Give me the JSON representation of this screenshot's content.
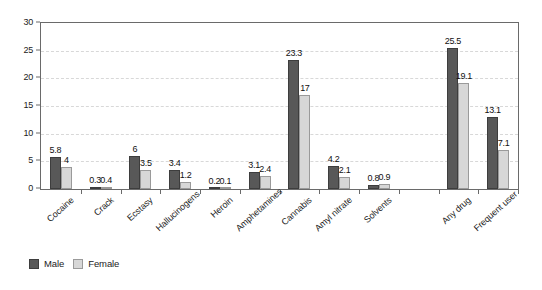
{
  "chart_data": {
    "type": "bar",
    "title": "",
    "subtitle": "",
    "xlabel": "",
    "ylabel": "",
    "ylim": [
      0,
      30
    ],
    "yticks": [
      0,
      5,
      10,
      15,
      20,
      25,
      30
    ],
    "ytick_labels": [
      "0",
      "5",
      "10",
      "15",
      "20",
      "25",
      "30"
    ],
    "grid": true,
    "grid_axis": "y",
    "grid_style": "dashed",
    "legend_position": "bottom-left",
    "categories": [
      "Cocaine",
      "Crack",
      "Ecstasy",
      "Hallucinogens",
      "Heroin",
      "Amphetamines",
      "Cannabis",
      "Amyl nitrate",
      "Solvents",
      "",
      "Any drug",
      "Frequent user"
    ],
    "series": [
      {
        "name": "Male",
        "color": "#585858",
        "values": [
          5.8,
          0.3,
          6,
          3.4,
          0.2,
          3.1,
          23.3,
          4.2,
          0.8,
          null,
          25.5,
          13.1
        ],
        "labels": [
          "5.8",
          "0.3",
          "6",
          "3.4",
          "0.2",
          "3.1",
          "23.3",
          "4.2",
          "0.8",
          "",
          "25.5",
          "13.1"
        ]
      },
      {
        "name": "Female",
        "color": "#d7d7d7",
        "values": [
          4,
          0.4,
          3.5,
          1.2,
          0.1,
          2.4,
          17,
          2.1,
          0.9,
          null,
          19.1,
          7.1
        ],
        "labels": [
          "4",
          "0.4",
          "3.5",
          "1.2",
          "0.1",
          "2.4",
          "17",
          "2.1",
          "0.9",
          "",
          "19.1",
          "7.1"
        ]
      }
    ]
  },
  "legend": {
    "items": [
      {
        "label": "Male",
        "color": "#585858"
      },
      {
        "label": "Female",
        "color": "#d7d7d7"
      }
    ]
  },
  "colors": {
    "male": "#585858",
    "female": "#d7d7d7",
    "axis": "#6a6a6a",
    "grid": "#d8d8d8",
    "text": "#1b1b1b",
    "background": "#ffffff"
  }
}
